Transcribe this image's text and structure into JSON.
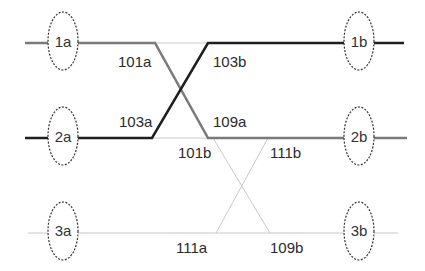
{
  "nodes": [
    {
      "id": "1a",
      "label": "1a"
    },
    {
      "id": "2a",
      "label": "2a"
    },
    {
      "id": "3a",
      "label": "3a"
    },
    {
      "id": "1b",
      "label": "1b"
    },
    {
      "id": "2b",
      "label": "2b"
    },
    {
      "id": "3b",
      "label": "3b"
    }
  ],
  "edge_labels": {
    "l101a": "101a",
    "l103a": "103a",
    "l103b": "103b",
    "l109a": "109a",
    "l101b": "101b",
    "l111b": "111b",
    "l111a": "111a",
    "l109b": "109b"
  },
  "colors": {
    "dark": "#1e1e1e",
    "medium": "#7a7a7a",
    "light": "#c8c8c8",
    "ellipse": "#333333"
  }
}
